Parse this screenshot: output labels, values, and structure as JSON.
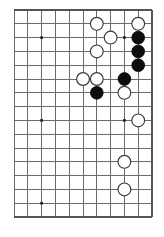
{
  "diagram": {
    "kind": "go-board-diagram",
    "board": {
      "columns": 11,
      "rows": 16,
      "cell_size": 13.8,
      "origin_x": 14.0,
      "origin_y": 10.0,
      "edges_drawn": [
        "top",
        "right",
        "bottom"
      ],
      "left_edge_drawn": false,
      "line_color": "#6b6b6b",
      "edge_color": "#555555",
      "background_color": "#ffffff"
    },
    "star_points": [
      {
        "col": 2,
        "row": 2
      },
      {
        "col": 2,
        "row": 8
      },
      {
        "col": 8,
        "row": 2
      },
      {
        "col": 2,
        "row": 14
      },
      {
        "col": 8,
        "row": 8
      }
    ],
    "stone_colors": {
      "black": "#0d0d0d",
      "white": "#ffffff",
      "white_outline": "#3a3a3a"
    },
    "stone_radius": 6.4,
    "stones": [
      {
        "color": "white",
        "col": 6,
        "row": 1
      },
      {
        "color": "white",
        "col": 9,
        "row": 1
      },
      {
        "color": "white",
        "col": 7,
        "row": 2
      },
      {
        "color": "black",
        "col": 9,
        "row": 2
      },
      {
        "color": "white",
        "col": 6,
        "row": 3
      },
      {
        "color": "black",
        "col": 9,
        "row": 3
      },
      {
        "color": "black",
        "col": 9,
        "row": 4
      },
      {
        "color": "white",
        "col": 5,
        "row": 5
      },
      {
        "color": "white",
        "col": 6,
        "row": 5
      },
      {
        "color": "black",
        "col": 8,
        "row": 5
      },
      {
        "color": "black",
        "col": 6,
        "row": 6
      },
      {
        "color": "white",
        "col": 8,
        "row": 6
      },
      {
        "color": "white",
        "col": 9,
        "row": 8
      },
      {
        "color": "white",
        "col": 8,
        "row": 11
      },
      {
        "color": "white",
        "col": 8,
        "row": 13
      }
    ],
    "stone_counts": {
      "black_label": "Black stones",
      "black": 5,
      "white_label": "White stones",
      "white": 10,
      "total_label": "Total stones",
      "total": 15
    }
  }
}
